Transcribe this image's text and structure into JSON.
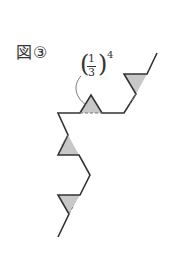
{
  "figure": {
    "label": "図③",
    "annotation": {
      "paren_open": "(",
      "numerator": "1",
      "denominator": "3",
      "paren_close": ")",
      "exponent": "4"
    },
    "colors": {
      "line": "#333333",
      "fill": "#c8c8c8"
    }
  }
}
